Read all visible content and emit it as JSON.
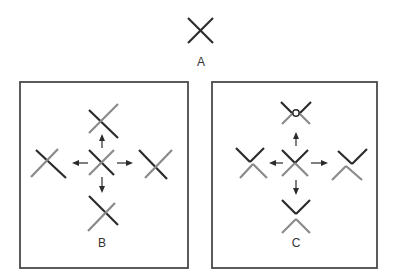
{
  "figure": {
    "panels": [
      {
        "id": "A",
        "label": "A",
        "description": "Single crossing (X) of two lines, both dark"
      },
      {
        "id": "B",
        "label": "B",
        "description": "Central crossing with arrows to four displaced crossings; each crossing has one dark and one gray line still intersecting"
      },
      {
        "id": "C",
        "label": "C",
        "description": "Central crossing with arrows to four displaced configurations; lines separate into a dark upper V and gray lower inverted-V"
      }
    ],
    "colors": {
      "dark_line": "#2b2b2b",
      "gray_line": "#8a8a8a",
      "frame": "#4a4a4a",
      "background": "#ffffff"
    },
    "arrow_directions": [
      "up",
      "left",
      "right",
      "down"
    ]
  }
}
